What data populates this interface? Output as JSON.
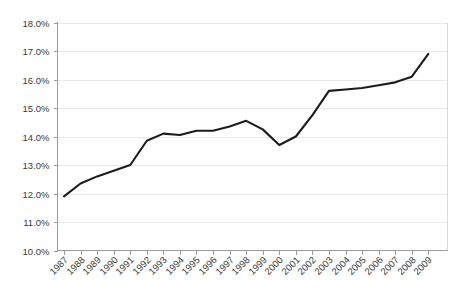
{
  "chart_data": {
    "type": "line",
    "title": "",
    "subtitle": "",
    "xlabel": "",
    "ylabel": "",
    "grid": true,
    "legend": false,
    "legend_position": "none",
    "line_color": "#1c1c1c",
    "grid_color": "#e9e9e9",
    "axis_color": "#9a9a9a",
    "label_color": "#3a3a3a",
    "ylim": [
      10.0,
      18.0
    ],
    "ytick_step": 1.0,
    "ytick_labels": [
      "18.0%",
      "17.0%",
      "16.0%",
      "15.0%",
      "14.0%",
      "13.0%",
      "12.0%",
      "11.0%",
      "10.0%"
    ],
    "ytick_values": [
      18.0,
      17.0,
      16.0,
      15.0,
      14.0,
      13.0,
      12.0,
      11.0,
      10.0
    ],
    "categories": [
      "1987",
      "1988",
      "1989",
      "1990",
      "1991",
      "1992",
      "1993",
      "1994",
      "1995",
      "1996",
      "1997",
      "1998",
      "1999",
      "2000",
      "2001",
      "2002",
      "2003",
      "2004",
      "2005",
      "2006",
      "2007",
      "2008",
      "2009"
    ],
    "values": [
      11.9,
      12.35,
      12.6,
      12.8,
      13.0,
      13.85,
      14.1,
      14.05,
      14.2,
      14.2,
      14.35,
      14.55,
      14.25,
      13.7,
      14.0,
      14.75,
      15.6,
      15.65,
      15.7,
      15.8,
      15.9,
      16.1,
      16.9
    ],
    "series": [
      {
        "name": "",
        "values": [
          11.9,
          12.35,
          12.6,
          12.8,
          13.0,
          13.85,
          14.1,
          14.05,
          14.2,
          14.2,
          14.35,
          14.55,
          14.25,
          13.7,
          14.0,
          14.75,
          15.6,
          15.65,
          15.7,
          15.8,
          15.9,
          16.1,
          16.9
        ]
      }
    ],
    "annotations": []
  }
}
